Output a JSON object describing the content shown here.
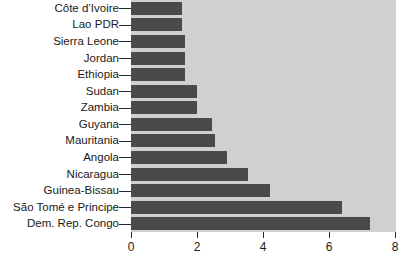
{
  "chart_data": {
    "type": "bar",
    "orientation": "horizontal",
    "title": "",
    "subtitle": "",
    "xlabel": "",
    "ylabel": "",
    "xlim": [
      0,
      8
    ],
    "ylim": null,
    "grid": false,
    "legend": null,
    "legend_position": "none",
    "xticks": [
      0,
      2,
      4,
      6,
      8
    ],
    "xtick_labels": [
      "0",
      "2",
      "4",
      "6",
      "8"
    ],
    "categories": [
      "Côte d’Ivoire",
      "Lao PDR",
      "Sierra Leone",
      "Jordan",
      "Ethiopia",
      "Sudan",
      "Zambia",
      "Guyana",
      "Mauritania",
      "Angola",
      "Nicaragua",
      "Guinea-Bissau",
      "São Tomé e Principe",
      "Dem. Rep. Congo"
    ],
    "values": [
      1.55,
      1.55,
      1.65,
      1.65,
      1.65,
      2.0,
      2.0,
      2.45,
      2.55,
      2.9,
      3.55,
      4.2,
      6.4,
      7.25
    ],
    "series": [
      {
        "name": "",
        "values": [
          1.55,
          1.55,
          1.65,
          1.65,
          1.65,
          2.0,
          2.0,
          2.45,
          2.55,
          2.9,
          3.55,
          4.2,
          6.4,
          7.25
        ]
      }
    ],
    "annotations": []
  },
  "colors": {
    "bar": "#4a4a4a",
    "plot_background": "#d0d0d0",
    "figure_background": "#ffffff",
    "axis": "#2a2a2a",
    "text": "#1a1a1a"
  }
}
